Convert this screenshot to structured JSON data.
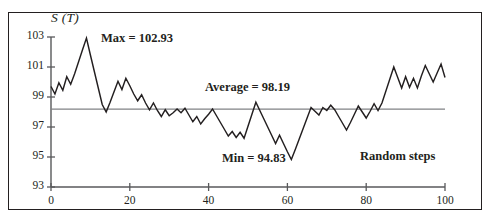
{
  "chart_data": {
    "type": "line",
    "title": "",
    "subtitle": "",
    "xlabel": "Random steps",
    "ylabel": "S (T)",
    "xlim": [
      0,
      100
    ],
    "ylim": [
      93,
      103
    ],
    "xticks": [
      0,
      20,
      40,
      60,
      80,
      100
    ],
    "yticks": [
      93,
      95,
      97,
      99,
      101,
      103
    ],
    "xtick_labels": [
      "0",
      "20",
      "40",
      "60",
      "80",
      "100"
    ],
    "ytick_labels": [
      "93",
      "95",
      "97",
      "99",
      "101",
      "103"
    ],
    "grid": false,
    "legend": "none",
    "series": [
      {
        "name": "S (T)",
        "color": "#231f20",
        "x": [
          0,
          1,
          2,
          3,
          4,
          5,
          6,
          7,
          8,
          9,
          10,
          11,
          12,
          13,
          14,
          15,
          16,
          17,
          18,
          19,
          20,
          21,
          22,
          23,
          24,
          25,
          26,
          27,
          28,
          29,
          30,
          31,
          32,
          33,
          34,
          35,
          36,
          37,
          38,
          39,
          40,
          41,
          42,
          43,
          44,
          45,
          46,
          47,
          48,
          49,
          50,
          51,
          52,
          53,
          54,
          55,
          56,
          57,
          58,
          59,
          60,
          61,
          62,
          63,
          64,
          65,
          66,
          67,
          68,
          69,
          70,
          71,
          72,
          73,
          74,
          75,
          76,
          77,
          78,
          79,
          80,
          81,
          82,
          83,
          84,
          85,
          86,
          87,
          88,
          89,
          90,
          91,
          92,
          93,
          94,
          95,
          96,
          97,
          98,
          99,
          100
        ],
        "values": [
          99.7,
          99.2,
          99.95,
          99.45,
          100.35,
          99.85,
          100.55,
          101.35,
          102.15,
          102.93,
          101.8,
          100.7,
          99.6,
          98.5,
          98.0,
          98.65,
          99.35,
          100.05,
          99.5,
          100.25,
          99.75,
          99.2,
          98.75,
          99.15,
          98.6,
          98.15,
          98.6,
          98.1,
          97.7,
          98.15,
          97.75,
          97.95,
          98.2,
          97.95,
          98.25,
          97.8,
          97.35,
          97.7,
          97.2,
          97.55,
          97.85,
          98.2,
          97.75,
          97.3,
          96.85,
          96.4,
          96.7,
          96.3,
          96.65,
          96.25,
          97.05,
          97.85,
          98.65,
          98.1,
          97.55,
          97.0,
          96.45,
          95.9,
          96.45,
          95.9,
          95.35,
          94.83,
          95.5,
          96.2,
          96.9,
          97.6,
          98.3,
          98.05,
          97.8,
          98.3,
          98.1,
          98.45,
          98.15,
          97.7,
          97.25,
          96.8,
          97.3,
          97.85,
          98.4,
          98.0,
          97.6,
          98.05,
          98.55,
          98.1,
          98.6,
          99.4,
          100.2,
          101.0,
          100.3,
          99.6,
          100.35,
          99.65,
          100.25,
          99.6,
          100.4,
          101.1,
          100.55,
          100.0,
          100.6,
          101.2,
          100.3
        ]
      }
    ],
    "reference_lines": [
      {
        "name": "average",
        "value": 98.19,
        "orientation": "horizontal",
        "color": "#808285",
        "x_start": 0,
        "x_end": 100
      }
    ],
    "annotations": [
      {
        "name": "max-annotation",
        "text": "Max = 102.93",
        "value": 102.93,
        "at_x": 9
      },
      {
        "name": "average-annotation",
        "text": "Average = 98.19",
        "value": 98.19
      },
      {
        "name": "min-annotation",
        "text": "Min = 94.83",
        "value": 94.83,
        "at_x": 61
      },
      {
        "name": "xaxis-caption",
        "text": "Random steps"
      }
    ]
  },
  "labels": {
    "y_axis_title": "S (T)",
    "x_axis_caption": "Random steps",
    "max_text": "Max = 102.93",
    "average_text": "Average = 98.19",
    "min_text": "Min = 94.83"
  },
  "colors": {
    "series": "#231f20",
    "average_line": "#808285",
    "axis": "#58595b",
    "frame": "#231f20",
    "background": "#ffffff"
  }
}
